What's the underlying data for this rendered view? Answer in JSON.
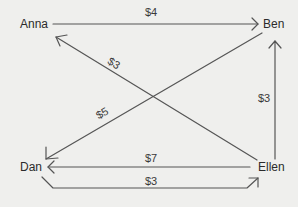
{
  "diagram": {
    "type": "debt-flow",
    "line_color": "#555555",
    "background": "#efefed",
    "nodes": [
      {
        "id": "anna",
        "label": "Anna"
      },
      {
        "id": "ben",
        "label": "Ben"
      },
      {
        "id": "dan",
        "label": "Dan"
      },
      {
        "id": "ellen",
        "label": "Ellen"
      }
    ],
    "edges": [
      {
        "from": "Anna",
        "to": "Ben",
        "amount": "$4"
      },
      {
        "from": "Ellen",
        "to": "Anna",
        "amount": "$3"
      },
      {
        "from": "Ben",
        "to": "Dan",
        "amount": "$5"
      },
      {
        "from": "Ellen",
        "to": "Ben",
        "amount": "$3"
      },
      {
        "from": "Ellen",
        "to": "Dan",
        "amount": "$7"
      },
      {
        "from": "Dan",
        "to": "Ellen",
        "amount": "$3"
      }
    ]
  }
}
